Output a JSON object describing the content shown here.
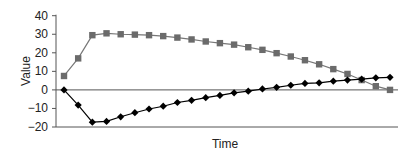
{
  "chart_data": {
    "type": "line",
    "title": "",
    "xlabel": "Time",
    "ylabel": "Value",
    "ylim": [
      -20,
      40
    ],
    "yticks": [
      40,
      30,
      20,
      10,
      0,
      -10,
      -20
    ],
    "grid": false,
    "legend": null,
    "x": [
      1,
      2,
      3,
      4,
      5,
      6,
      7,
      8,
      9,
      10,
      11,
      12,
      13,
      14,
      15,
      16,
      17,
      18,
      19,
      20,
      21,
      22,
      23,
      24
    ],
    "series": [
      {
        "name": "Series 1",
        "marker": "square",
        "color": "#6b6b6b",
        "values": [
          7.5,
          17,
          29.5,
          30.5,
          30,
          29.8,
          29.5,
          29,
          28.2,
          27.2,
          26.1,
          25.2,
          24.4,
          23,
          21.6,
          19.8,
          18,
          16,
          13.8,
          11.2,
          8.6,
          5.3,
          2,
          0
        ]
      },
      {
        "name": "Series 2",
        "marker": "diamond",
        "color": "#000000",
        "values": [
          0,
          -8.2,
          -17.4,
          -17,
          -14.5,
          -12.3,
          -10.3,
          -8.8,
          -6.8,
          -5.6,
          -4.2,
          -3,
          -1.6,
          -0.7,
          0.5,
          1.4,
          2.5,
          3.5,
          3.8,
          4.7,
          5.3,
          5.8,
          6.5,
          6.8
        ]
      }
    ]
  }
}
